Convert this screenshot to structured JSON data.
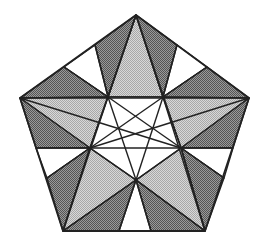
{
  "diagram": {
    "title": "",
    "shades": {
      "dark": "#7a7a7a",
      "light": "#bdbdbd",
      "white": "#ffffff",
      "stroke": "#222222"
    },
    "points": {
      "T": [
        136,
        15
      ],
      "L": [
        20,
        98
      ],
      "R": [
        249,
        98
      ],
      "BL": [
        63,
        231
      ],
      "BR": [
        205,
        231
      ],
      "P1": [
        108,
        97
      ],
      "P2": [
        163,
        97
      ],
      "P3": [
        90,
        148
      ],
      "P4": [
        181,
        148
      ],
      "P5": [
        136,
        180
      ],
      "E1": [
        64,
        67
      ],
      "E2": [
        95,
        45
      ],
      "E3": [
        177,
        45
      ],
      "E4": [
        207,
        67
      ],
      "E5": [
        36,
        148
      ],
      "E6": [
        47,
        178
      ],
      "E7": [
        233,
        148
      ],
      "E8": [
        224,
        178
      ],
      "E9": [
        119,
        231
      ],
      "E10": [
        151,
        231
      ]
    },
    "regions": [
      {
        "name": "top-center-light",
        "pts": [
          "T",
          "P1",
          "P2"
        ],
        "shade": "light"
      },
      {
        "name": "top-left-dark",
        "pts": [
          "T",
          "E2",
          "P1"
        ],
        "shade": "dark"
      },
      {
        "name": "top-right-dark",
        "pts": [
          "T",
          "P2",
          "E3"
        ],
        "shade": "dark"
      },
      {
        "name": "top-left-white",
        "pts": [
          "E2",
          "E1",
          "P1"
        ],
        "shade": "white"
      },
      {
        "name": "top-right-white",
        "pts": [
          "E3",
          "P2",
          "E4"
        ],
        "shade": "white"
      },
      {
        "name": "upper-left-dark",
        "pts": [
          "E1",
          "L",
          "P1"
        ],
        "shade": "dark"
      },
      {
        "name": "upper-right-dark",
        "pts": [
          "E4",
          "P2",
          "R"
        ],
        "shade": "dark"
      },
      {
        "name": "left-light",
        "pts": [
          "L",
          "P1",
          "P3"
        ],
        "shade": "light"
      },
      {
        "name": "right-light",
        "pts": [
          "R",
          "P2",
          "P4"
        ],
        "shade": "light"
      },
      {
        "name": "left-mid-dark",
        "pts": [
          "L",
          "P3",
          "E5"
        ],
        "shade": "dark"
      },
      {
        "name": "right-mid-dark",
        "pts": [
          "R",
          "E7",
          "P4"
        ],
        "shade": "dark"
      },
      {
        "name": "left-white",
        "pts": [
          "E5",
          "P3",
          "E6"
        ],
        "shade": "white"
      },
      {
        "name": "right-white",
        "pts": [
          "E7",
          "E8",
          "P4"
        ],
        "shade": "white"
      },
      {
        "name": "lower-left-dark",
        "pts": [
          "E6",
          "P3",
          "BL"
        ],
        "shade": "dark"
      },
      {
        "name": "lower-right-dark",
        "pts": [
          "E8",
          "BR",
          "P4"
        ],
        "shade": "dark"
      },
      {
        "name": "bottom-left-light",
        "pts": [
          "BL",
          "P3",
          "P5"
        ],
        "shade": "light"
      },
      {
        "name": "bottom-right-light",
        "pts": [
          "BR",
          "P5",
          "P4"
        ],
        "shade": "light"
      },
      {
        "name": "bottom-left-dark",
        "pts": [
          "BL",
          "P5",
          "E9"
        ],
        "shade": "dark"
      },
      {
        "name": "bottom-right-dark",
        "pts": [
          "BR",
          "E10",
          "P5"
        ],
        "shade": "dark"
      },
      {
        "name": "bottom-white",
        "pts": [
          "E9",
          "P5",
          "E10"
        ],
        "shade": "white"
      },
      {
        "name": "center-white",
        "pts": [
          "P1",
          "P2",
          "P4",
          "P5",
          "P3"
        ],
        "shade": "white"
      }
    ],
    "lines": [
      [
        "L",
        "R"
      ],
      [
        "E5",
        "E7"
      ],
      [
        "T",
        "P1"
      ],
      [
        "T",
        "P2"
      ],
      [
        "P1",
        "P5"
      ],
      [
        "P2",
        "P5"
      ],
      [
        "P1",
        "P4"
      ],
      [
        "P2",
        "P3"
      ],
      [
        "L",
        "P4"
      ],
      [
        "R",
        "P3"
      ],
      [
        "BL",
        "P3"
      ],
      [
        "BR",
        "P4"
      ],
      [
        "BL",
        "P5"
      ],
      [
        "BR",
        "P5"
      ],
      [
        "P3",
        "T"
      ],
      [
        "P4",
        "T"
      ],
      [
        "E2",
        "P1"
      ],
      [
        "E3",
        "P2"
      ],
      [
        "E1",
        "P1"
      ],
      [
        "E4",
        "P2"
      ],
      [
        "E6",
        "P3"
      ],
      [
        "E8",
        "P4"
      ],
      [
        "E9",
        "P5"
      ],
      [
        "E10",
        "P5"
      ],
      [
        "P3",
        "P5"
      ],
      [
        "P4",
        "P5"
      ],
      [
        "BL",
        "P1"
      ],
      [
        "BR",
        "P2"
      ]
    ],
    "outline": [
      "T",
      "R",
      "BR",
      "BL",
      "L"
    ]
  }
}
